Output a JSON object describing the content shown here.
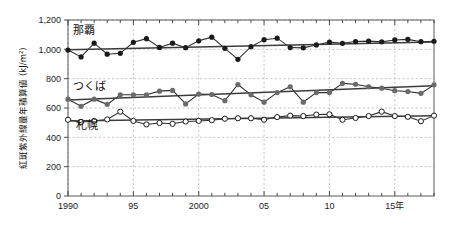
{
  "chart_data": {
    "type": "line",
    "title": "",
    "subtitle": "",
    "xlabel": "",
    "ylabel": "紅斑紫外線量年積算値 (kJ/m²)",
    "ylim": [
      0,
      1200
    ],
    "xlim": [
      1990,
      2018
    ],
    "ytick_values": [
      0,
      200,
      400,
      600,
      800,
      1000,
      1200
    ],
    "ytick_labels": [
      "0",
      "200",
      "400",
      "600",
      "800",
      "1,000",
      "1,200"
    ],
    "xtick_values": [
      1990,
      1995,
      2000,
      2005,
      2010,
      2015
    ],
    "xtick_labels": [
      "1990",
      "95",
      "2000",
      "05",
      "10",
      "15年"
    ],
    "xtick_minor_step": 1,
    "grid": "both-dashed",
    "legend": "inline-annotations",
    "annotations": [
      {
        "text": "那覇",
        "x": 1990.4,
        "y": 1105
      },
      {
        "text": "つくば",
        "x": 1990.4,
        "y": 725
      },
      {
        "text": "札幌",
        "x": 1990.6,
        "y": 455
      }
    ],
    "x": [
      1990,
      1991,
      1992,
      1993,
      1994,
      1995,
      1996,
      1997,
      1998,
      1999,
      2000,
      2001,
      2002,
      2003,
      2004,
      2005,
      2006,
      2007,
      2008,
      2009,
      2010,
      2011,
      2012,
      2013,
      2014,
      2015,
      2016,
      2017,
      2018
    ],
    "series": [
      {
        "name": "那覇",
        "marker": "filled-circle",
        "color": "#1a1a1a",
        "values": [
          995,
          948,
          1042,
          967,
          973,
          1048,
          1073,
          1013,
          1042,
          1011,
          1058,
          1083,
          1007,
          932,
          1018,
          1066,
          1076,
          1012,
          1010,
          1030,
          1049,
          1041,
          1053,
          1056,
          1051,
          1064,
          1068,
          1052,
          1055
        ],
        "trend": {
          "start_year": 1990,
          "end_year": 2018,
          "start_value": 998,
          "end_value": 1050
        }
      },
      {
        "name": "つくば",
        "marker": "filled-circle-gray",
        "color": "#6a6a6a",
        "values": [
          660,
          612,
          660,
          625,
          690,
          690,
          690,
          715,
          720,
          628,
          695,
          692,
          650,
          760,
          690,
          640,
          705,
          745,
          640,
          705,
          705,
          768,
          762,
          745,
          735,
          718,
          712,
          700,
          758
        ],
        "trend": {
          "start_year": 1990,
          "end_year": 2018,
          "start_value": 655,
          "end_value": 752
        }
      },
      {
        "name": "札幌",
        "marker": "open-circle",
        "color": "#1a1a1a",
        "values": [
          520,
          505,
          512,
          522,
          575,
          512,
          488,
          498,
          492,
          508,
          512,
          517,
          527,
          530,
          530,
          520,
          538,
          548,
          545,
          555,
          557,
          520,
          532,
          545,
          575,
          545,
          540,
          510,
          548
        ],
        "trend": {
          "start_year": 1990,
          "end_year": 2018,
          "start_value": 512,
          "end_value": 548
        }
      }
    ]
  },
  "layout": {
    "plot_left": 68,
    "plot_right": 434,
    "plot_top": 20,
    "plot_bottom": 196
  }
}
